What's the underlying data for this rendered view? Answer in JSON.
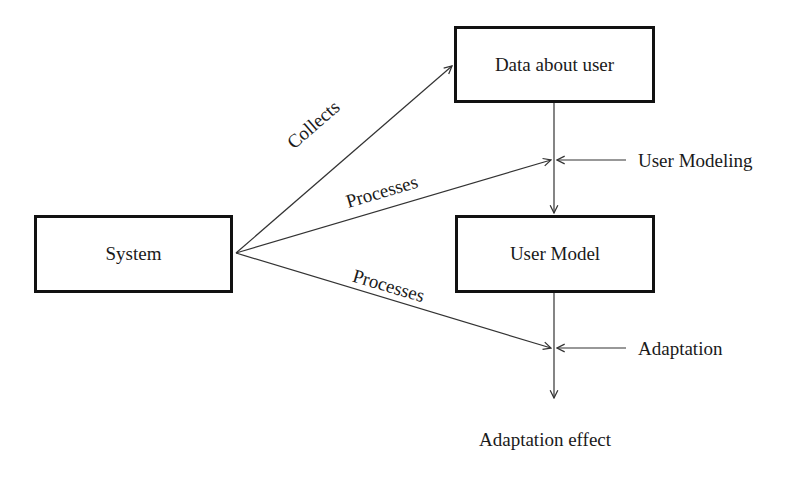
{
  "diagram": {
    "nodes": {
      "system": "System",
      "data_about_user": "Data about user",
      "user_model": "User Model",
      "adaptation_effect": "Adaptation effect"
    },
    "edges": {
      "collects": "Collects",
      "processes_upper": "Processes",
      "processes_lower": "Processes"
    },
    "processes": {
      "user_modeling": "User Modeling",
      "adaptation": "Adaptation"
    },
    "colors": {
      "line": "#333333",
      "box_border": "#111111",
      "background": "#ffffff"
    }
  }
}
